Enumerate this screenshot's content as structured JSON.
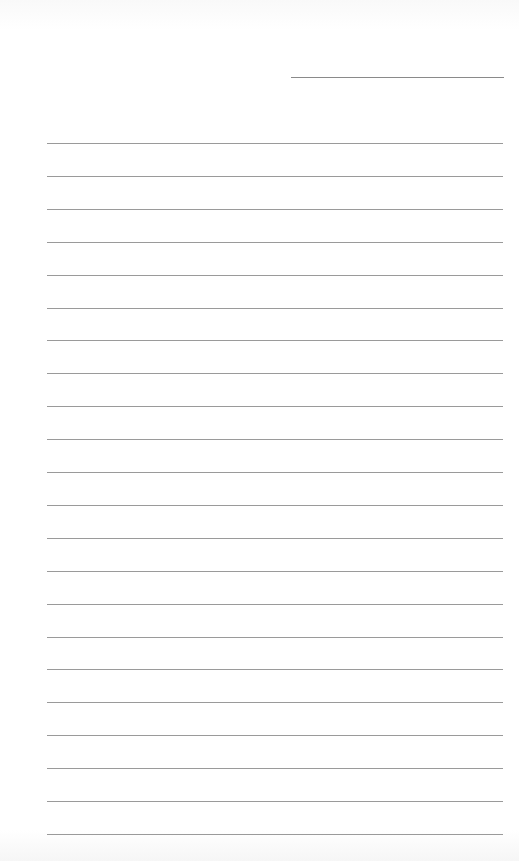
{
  "page": {
    "type": "lined-notepaper",
    "background": "#ffffff",
    "line_color": "#9a9a9a"
  },
  "header": {
    "date_line": {
      "label": "",
      "value": ""
    }
  },
  "body": {
    "line_count": 22,
    "lines": [
      "",
      "",
      "",
      "",
      "",
      "",
      "",
      "",
      "",
      "",
      "",
      "",
      "",
      "",
      "",
      "",
      "",
      "",
      "",
      "",
      "",
      ""
    ]
  }
}
